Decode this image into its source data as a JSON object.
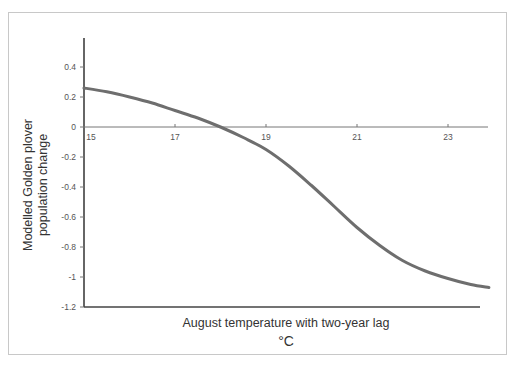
{
  "chart_data": {
    "type": "line",
    "title": "",
    "xlabel": "August temperature with two-year lag",
    "xlabel_unit": "°C",
    "ylabel_line1": "Modelled Golden plover",
    "ylabel_line2": "population change",
    "xlim": [
      15,
      23.9
    ],
    "ylim": [
      -1.2,
      0.55
    ],
    "x_ticks": [
      15,
      17,
      19,
      21,
      23
    ],
    "y_ticks": [
      0.4,
      0.2,
      0,
      -0.2,
      -0.4,
      -0.6,
      -0.8,
      -1,
      -1.2
    ],
    "y_tick_labels": [
      "0.4",
      "0.2",
      "0",
      "-0.2",
      "-0.4",
      "-0.6",
      "-0.8",
      "-1",
      "-1.2"
    ],
    "grid": false,
    "legend": null,
    "series": [
      {
        "name": "Modelled population change",
        "color": "#6e6e6e",
        "x": [
          15,
          15.5,
          16,
          16.5,
          17,
          17.5,
          18,
          18.5,
          19,
          19.5,
          20,
          20.5,
          21,
          21.5,
          22,
          22.5,
          23,
          23.5,
          23.9
        ],
        "y": [
          0.26,
          0.235,
          0.2,
          0.16,
          0.11,
          0.06,
          0.0,
          -0.07,
          -0.15,
          -0.26,
          -0.39,
          -0.53,
          -0.67,
          -0.79,
          -0.89,
          -0.96,
          -1.01,
          -1.05,
          -1.07
        ]
      }
    ]
  }
}
